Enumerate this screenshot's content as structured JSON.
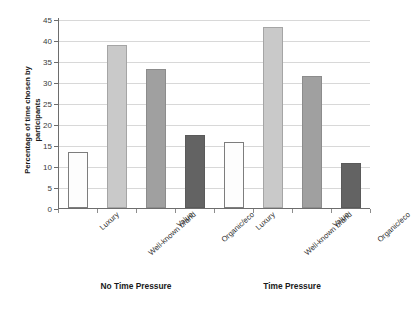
{
  "chart_data": {
    "type": "bar",
    "title": "",
    "subtitle": "",
    "xlabel": "",
    "ylabel": "Percentage of time chosen by participants",
    "ylabel_lines": [
      "Percentage of time chosen by",
      "participants"
    ],
    "ylim": [
      0,
      45
    ],
    "y_ticks": [
      0,
      5,
      10,
      15,
      20,
      25,
      30,
      35,
      40,
      45
    ],
    "y_tick_labels": [
      "0",
      "5",
      "10",
      "15",
      "20",
      "25",
      "30",
      "35",
      "40",
      "45"
    ],
    "grid": true,
    "grid_axis": "y",
    "legend": false,
    "legend_position": "none",
    "categories": [
      "Luxury",
      "Well-known brand",
      "Value",
      "Organic/eco"
    ],
    "groups": [
      {
        "label": "No Time Pressure",
        "bars": [
          {
            "category": "Luxury",
            "value": 13.3,
            "fill": "white",
            "color": "#fdfdfd"
          },
          {
            "category": "Well-known brand",
            "value": 38.7,
            "fill": "light-gray",
            "color": "#c9c9c9"
          },
          {
            "category": "Value",
            "value": 33.0,
            "fill": "medium-gray",
            "color": "#a0a0a0"
          },
          {
            "category": "Organic/eco",
            "value": 17.5,
            "fill": "dark-gray",
            "color": "#636363"
          }
        ]
      },
      {
        "label": "Time Pressure",
        "bars": [
          {
            "category": "Luxury",
            "value": 15.7,
            "fill": "white",
            "color": "#fdfdfd"
          },
          {
            "category": "Well-known brand",
            "value": 43.0,
            "fill": "light-gray",
            "color": "#c9c9c9"
          },
          {
            "category": "Value",
            "value": 31.5,
            "fill": "medium-gray",
            "color": "#a0a0a0"
          },
          {
            "category": "Organic/eco",
            "value": 10.6,
            "fill": "dark-gray",
            "color": "#636363"
          }
        ]
      }
    ],
    "series": [
      {
        "name": "No Time Pressure",
        "values": [
          13.3,
          38.7,
          33.0,
          17.5
        ]
      },
      {
        "name": "Time Pressure",
        "values": [
          15.7,
          43.0,
          31.5,
          10.6
        ]
      }
    ],
    "colors": {
      "white": "#fdfdfd",
      "light_gray": "#c9c9c9",
      "medium_gray": "#a0a0a0",
      "dark_gray": "#636363",
      "axis": "#6d6d6d",
      "grid": "#d8d8d8",
      "text": "#1a1a1a",
      "background": "#ffffff"
    }
  }
}
